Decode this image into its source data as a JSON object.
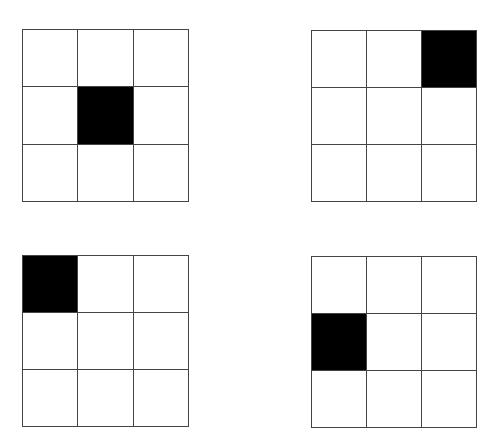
{
  "grids": [
    {
      "id": "top-left",
      "rows": 3,
      "cols": 3,
      "filled": [
        [
          1,
          1
        ]
      ],
      "x": 22,
      "y": 29,
      "w": 167,
      "h": 173
    },
    {
      "id": "top-right",
      "rows": 3,
      "cols": 3,
      "filled": [
        [
          0,
          2
        ]
      ],
      "x": 311,
      "y": 30,
      "w": 166,
      "h": 172
    },
    {
      "id": "bottom-left",
      "rows": 3,
      "cols": 3,
      "filled": [
        [
          0,
          0
        ]
      ],
      "x": 22,
      "y": 255,
      "w": 167,
      "h": 172
    },
    {
      "id": "bottom-right",
      "rows": 3,
      "cols": 3,
      "filled": [
        [
          1,
          0
        ]
      ],
      "x": 311,
      "y": 256,
      "w": 166,
      "h": 172
    }
  ],
  "colors": {
    "filled": "#000000",
    "empty": "#ffffff",
    "line": "#444444"
  }
}
